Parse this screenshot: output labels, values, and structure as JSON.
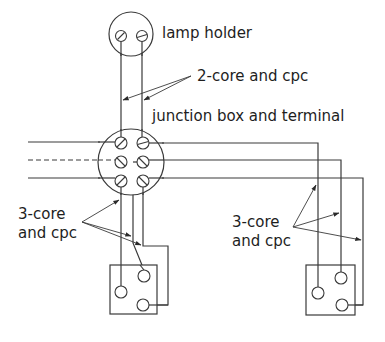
{
  "diagram": {
    "title": "",
    "labels": {
      "lamp_holder": "lamp holder",
      "two_core": "2-core and cpc",
      "junction_box": "junction box and terminal",
      "three_core_left_line1": "3-core",
      "three_core_left_line2": "and cpc",
      "three_core_right_line1": "3-core",
      "three_core_right_line2": "and cpc"
    },
    "components": [
      {
        "id": "lamp-holder",
        "type": "circle-with-2-terminals"
      },
      {
        "id": "junction-box",
        "type": "circle-with-6-terminals"
      },
      {
        "id": "switch-left",
        "type": "two-way-switch",
        "terminals": 3
      },
      {
        "id": "switch-right",
        "type": "two-way-switch",
        "terminals": 3
      }
    ],
    "colors": {
      "line": "#3a3a3a",
      "text": "#1e1e1e",
      "background": "#ffffff"
    }
  }
}
